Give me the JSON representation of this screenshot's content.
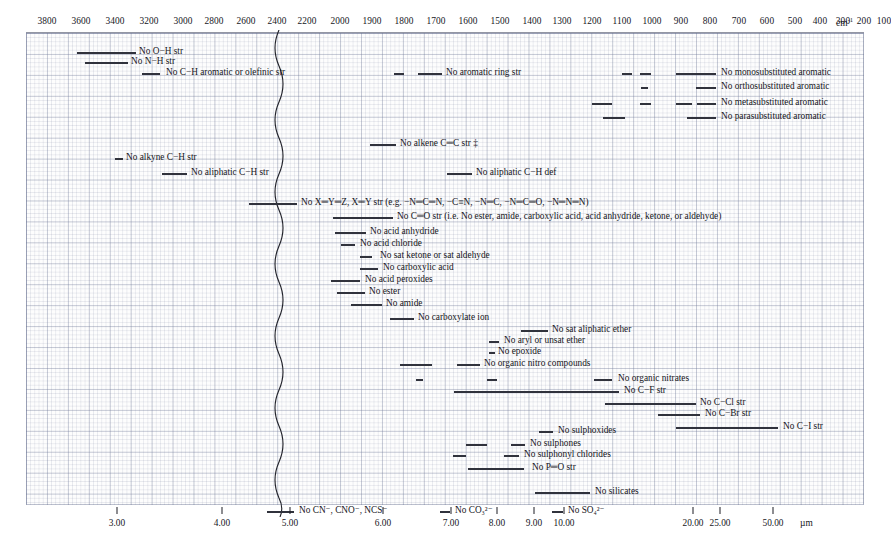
{
  "axes": {
    "top": {
      "unit_label": "cm",
      "unit_sup": "-1",
      "ticks": [
        3800,
        3600,
        3400,
        3200,
        3000,
        2800,
        2600,
        2400,
        2200,
        2000,
        1900,
        1800,
        1700,
        1600,
        1500,
        1400,
        1300,
        1200,
        1100,
        1000,
        900,
        800,
        700,
        600,
        500,
        400,
        300,
        200,
        100
      ]
    },
    "bottom": {
      "unit_label": "µm",
      "ticks": [
        "3.00",
        "4.00",
        "5.00",
        "6.00",
        "7.00",
        "8.00",
        "9.00",
        "10.00",
        "20.00",
        "25.00",
        "50.00"
      ]
    }
  },
  "scale_break": {
    "name": "scale-break-squiggle",
    "wavenumber": 2000
  },
  "chart_data": {
    "type": "bar",
    "xlabel": "cm-1",
    "ylabel": "",
    "orientation": "horizontal-range-bars",
    "xlim_left_segment": [
      4000,
      2000
    ],
    "xlim_right_segment": [
      2000,
      0
    ],
    "grid": true,
    "legend": null,
    "rows": [
      {
        "label": "No O−H str",
        "label_x": 139,
        "segments": [
          [
            77,
            136
          ]
        ]
      },
      {
        "label": "No N−H str",
        "label_x": 131,
        "segments": [
          [
            85,
            128
          ]
        ]
      },
      {
        "label": "No C−H aromatic or olefinic str",
        "label_x": 166,
        "segments": [
          [
            142,
            160
          ]
        ]
      },
      {
        "label": "No aromatic ring str",
        "label_x": 446,
        "segments": [
          [
            394,
            404
          ],
          [
            418,
            442
          ]
        ]
      },
      {
        "label": "No monosubstituted aromatic",
        "label_x": 721,
        "segments": [
          [
            622,
            632
          ],
          [
            640,
            651
          ],
          [
            676,
            716
          ]
        ]
      },
      {
        "label": "No orthosubstituted aromatic",
        "label_x": 721,
        "segments": [
          [
            641,
            648
          ],
          [
            696,
            716
          ]
        ]
      },
      {
        "label": "No metasubstituted aromatic",
        "label_x": 721,
        "segments": [
          [
            592,
            612
          ],
          [
            640,
            651
          ],
          [
            676,
            692
          ],
          [
            697,
            716
          ]
        ]
      },
      {
        "label": "No parasubstituted aromatic",
        "label_x": 721,
        "segments": [
          [
            603,
            625
          ],
          [
            687,
            716
          ]
        ]
      },
      {
        "label": "No alkene C═C str ‡",
        "label_x": 400,
        "segments": [
          [
            370,
            396
          ]
        ]
      },
      {
        "label": "No alkyne C−H str",
        "label_x": 126,
        "segments": [
          [
            115,
            123
          ]
        ]
      },
      {
        "label": "No aliphatic C−H str",
        "label_x": 191,
        "segments": [
          [
            162,
            187
          ]
        ]
      },
      {
        "label": "No aliphatic C−H def",
        "label_x": 476,
        "segments": [
          [
            447,
            472
          ]
        ]
      },
      {
        "label": "No X═Y═Z, X═Y str (e.g. −N═C═N, −C≡N, −N═C, −N═C═O, −N═N═N)",
        "label_x": 301,
        "segments": [
          [
            249,
            297
          ]
        ]
      },
      {
        "label": "No C═O str (i.e. No ester, amide, carboxylic acid, acid anhydride, ketone, or aldehyde)",
        "label_x": 397,
        "segments": [
          [
            333,
            393
          ]
        ]
      },
      {
        "label": "No acid anhydride",
        "label_x": 370,
        "segments": [
          [
            335,
            366
          ]
        ]
      },
      {
        "label": "No acid chloride",
        "label_x": 360,
        "segments": [
          [
            341,
            355
          ]
        ]
      },
      {
        "label": "No sat ketone or sat aldehyde",
        "label_x": 380,
        "segments": [
          [
            360,
            372
          ]
        ]
      },
      {
        "label": "No carboxylic acid",
        "label_x": 383,
        "segments": [
          [
            360,
            378
          ]
        ]
      },
      {
        "label": "No acid peroxides",
        "label_x": 365,
        "segments": [
          [
            331,
            360
          ]
        ]
      },
      {
        "label": "No ester",
        "label_x": 369,
        "segments": [
          [
            337,
            365
          ]
        ]
      },
      {
        "label": "No amide",
        "label_x": 386,
        "segments": [
          [
            351,
            382
          ]
        ]
      },
      {
        "label": "No carboxylate ion",
        "label_x": 418,
        "segments": [
          [
            390,
            414
          ]
        ]
      },
      {
        "label": "No sat aliphatic ether",
        "label_x": 552,
        "segments": [
          [
            521,
            548
          ]
        ]
      },
      {
        "label": "No aryl or unsat ether",
        "label_x": 504,
        "segments": [
          [
            489,
            499
          ]
        ]
      },
      {
        "label": "No epoxide",
        "label_x": 498,
        "segments": [
          [
            489,
            495
          ]
        ]
      },
      {
        "label": "No organic nitro compounds",
        "label_x": 484,
        "segments": [
          [
            400,
            432
          ]
        ],
        "segments_extra": [
          [
            457,
            480
          ]
        ]
      },
      {
        "label": "No organic nitrates",
        "label_x": 618,
        "segments": [
          [
            416,
            423
          ]
        ],
        "segments_extra": [
          [
            487,
            497
          ],
          [
            594,
            612
          ]
        ]
      },
      {
        "label": "No C−F str",
        "label_x": 624,
        "segments": [
          [
            454,
            619
          ]
        ]
      },
      {
        "label": "No C−Cl str",
        "label_x": 700,
        "segments": [
          [
            605,
            696
          ]
        ]
      },
      {
        "label": "No C−Br str",
        "label_x": 705,
        "segments": [
          [
            658,
            700
          ]
        ]
      },
      {
        "label": "No C−I str",
        "label_x": 783,
        "segments": [
          [
            676,
            778
          ]
        ]
      },
      {
        "label": "No sulphoxides",
        "label_x": 558,
        "segments": [
          [
            539,
            553
          ]
        ]
      },
      {
        "label": "No sulphones",
        "label_x": 530,
        "segments": [
          [
            466,
            487
          ],
          [
            511,
            525
          ]
        ]
      },
      {
        "label": "No sulphonyl chlorides",
        "label_x": 524,
        "segments": [
          [
            453,
            466
          ],
          [
            504,
            519
          ]
        ]
      },
      {
        "label": "No P═O str",
        "label_x": 532,
        "segments": [
          [
            468,
            524
          ]
        ]
      },
      {
        "label": "No silicates",
        "label_x": 595,
        "segments": [
          [
            535,
            590
          ]
        ]
      },
      {
        "label": "No CN⁻, CNO⁻, NCS⁻",
        "label_x": 299,
        "segments": [
          [
            267,
            294
          ]
        ]
      },
      {
        "label": "No CO₃²⁻",
        "label_x": 455,
        "segments": [
          [
            440,
            450
          ]
        ]
      },
      {
        "label": "No SO₄²⁻",
        "label_x": 568,
        "segments": [
          [
            552,
            563
          ]
        ]
      }
    ]
  },
  "rows_render": [
    {
      "y": 47,
      "label": "No O−H str",
      "label_x": 139,
      "bars": [
        [
          77,
          136
        ]
      ]
    },
    {
      "y": 57,
      "label": "No N−H str",
      "label_x": 131,
      "bars": [
        [
          85,
          128
        ]
      ]
    },
    {
      "y": 68,
      "label": "No C−H aromatic or olefinic str",
      "label_x": 166,
      "bars": [
        [
          142,
          160
        ]
      ]
    },
    {
      "y": 68,
      "label": "No aromatic ring str",
      "label_x": 446,
      "bars": [
        [
          394,
          404
        ],
        [
          418,
          442
        ]
      ]
    },
    {
      "y": 68,
      "label": "No monosubstituted aromatic",
      "label_x": 721,
      "bars": [
        [
          622,
          632
        ],
        [
          640,
          651
        ],
        [
          676,
          716
        ]
      ]
    },
    {
      "y": 82,
      "label": "No orthosubstituted aromatic",
      "label_x": 721,
      "bars": [
        [
          641,
          648
        ],
        [
          696,
          716
        ]
      ]
    },
    {
      "y": 98,
      "label": "No metasubstituted aromatic",
      "label_x": 721,
      "bars": [
        [
          592,
          612
        ],
        [
          640,
          651
        ],
        [
          676,
          692
        ],
        [
          697,
          716
        ]
      ]
    },
    {
      "y": 112,
      "label": "No parasubstituted aromatic",
      "label_x": 721,
      "bars": [
        [
          603,
          625
        ],
        [
          687,
          716
        ]
      ]
    },
    {
      "y": 139,
      "label": "No alkene C═C str ‡",
      "label_x": 400,
      "bars": [
        [
          370,
          396
        ]
      ]
    },
    {
      "y": 153,
      "label": "No alkyne C−H str",
      "label_x": 126,
      "bars": [
        [
          115,
          123
        ]
      ]
    },
    {
      "y": 168,
      "label": "No aliphatic C−H str",
      "label_x": 191,
      "bars": [
        [
          162,
          187
        ]
      ]
    },
    {
      "y": 168,
      "label": "No aliphatic C−H def",
      "label_x": 476,
      "bars": [
        [
          447,
          472
        ]
      ]
    },
    {
      "y": 198,
      "label": "No X═Y═Z, X═Y str (e.g. −N═C═N, −C≡N, −N═C, −N═C═O, −N═N═N)",
      "label_x": 301,
      "bars": [
        [
          249,
          297
        ]
      ]
    },
    {
      "y": 212,
      "label": "No C═O str (i.e. No ester, amide, carboxylic acid, acid anhydride, ketone, or aldehyde)",
      "label_x": 397,
      "bars": [
        [
          333,
          393
        ]
      ]
    },
    {
      "y": 227,
      "label": "No acid anhydride",
      "label_x": 370,
      "bars": [
        [
          335,
          366
        ]
      ]
    },
    {
      "y": 239,
      "label": "No acid chloride",
      "label_x": 360,
      "bars": [
        [
          341,
          355
        ]
      ]
    },
    {
      "y": 251,
      "label": "No sat ketone or sat aldehyde",
      "label_x": 380,
      "bars": [
        [
          360,
          372
        ]
      ]
    },
    {
      "y": 263,
      "label": "No carboxylic acid",
      "label_x": 383,
      "bars": [
        [
          360,
          378
        ]
      ]
    },
    {
      "y": 275,
      "label": "No acid peroxides",
      "label_x": 365,
      "bars": [
        [
          331,
          360
        ]
      ]
    },
    {
      "y": 287,
      "label": "No ester",
      "label_x": 369,
      "bars": [
        [
          337,
          365
        ]
      ]
    },
    {
      "y": 299,
      "label": "No amide",
      "label_x": 386,
      "bars": [
        [
          351,
          382
        ]
      ]
    },
    {
      "y": 313,
      "label": "No carboxylate ion",
      "label_x": 418,
      "bars": [
        [
          390,
          414
        ]
      ]
    },
    {
      "y": 325,
      "label": "No sat aliphatic ether",
      "label_x": 552,
      "bars": [
        [
          521,
          548
        ]
      ]
    },
    {
      "y": 336,
      "label": "No aryl or unsat ether",
      "label_x": 504,
      "bars": [
        [
          489,
          499
        ]
      ]
    },
    {
      "y": 347,
      "label": "No epoxide",
      "label_x": 498,
      "bars": [
        [
          489,
          495
        ]
      ]
    },
    {
      "y": 359,
      "label": "No organic nitro compounds",
      "label_x": 484,
      "bars": [
        [
          400,
          432
        ],
        [
          457,
          480
        ]
      ]
    },
    {
      "y": 374,
      "label": "No organic nitrates",
      "label_x": 618,
      "bars": [
        [
          416,
          423
        ],
        [
          487,
          497
        ],
        [
          594,
          612
        ]
      ]
    },
    {
      "y": 386,
      "label": "No C−F str",
      "label_x": 624,
      "bars": [
        [
          454,
          619
        ]
      ]
    },
    {
      "y": 398,
      "label": "No C−Cl str",
      "label_x": 700,
      "bars": [
        [
          605,
          696
        ]
      ]
    },
    {
      "y": 409,
      "label": "No C−Br str",
      "label_x": 705,
      "bars": [
        [
          658,
          700
        ]
      ]
    },
    {
      "y": 422,
      "label": "No C−I str",
      "label_x": 783,
      "bars": [
        [
          676,
          778
        ]
      ]
    },
    {
      "y": 426,
      "label": "No sulphoxides",
      "label_x": 558,
      "bars": [
        [
          539,
          553
        ]
      ]
    },
    {
      "y": 439,
      "label": "No sulphones",
      "label_x": 530,
      "bars": [
        [
          466,
          487
        ],
        [
          511,
          525
        ]
      ]
    },
    {
      "y": 450,
      "label": "No sulphonyl chlorides",
      "label_x": 524,
      "bars": [
        [
          453,
          466
        ],
        [
          504,
          519
        ]
      ]
    },
    {
      "y": 463,
      "label": "No P═O str",
      "label_x": 532,
      "bars": [
        [
          468,
          524
        ]
      ]
    },
    {
      "y": 487,
      "label": "No silicates",
      "label_x": 595,
      "bars": [
        [
          535,
          590
        ]
      ]
    },
    {
      "y": 506,
      "label": "No CN⁻, CNO⁻, NCS⁻",
      "label_x": 299,
      "bars": [
        [
          267,
          294
        ]
      ]
    },
    {
      "y": 506,
      "label": "No CO₃²⁻",
      "label_x": 455,
      "bars": [
        [
          440,
          450
        ]
      ]
    },
    {
      "y": 506,
      "label": "No SO₄²⁻",
      "label_x": 568,
      "bars": [
        [
          552,
          563
        ]
      ]
    }
  ],
  "top_tick_positions": [
    {
      "v": 3800,
      "x": 47
    },
    {
      "v": 3600,
      "x": 81
    },
    {
      "v": 3400,
      "x": 115
    },
    {
      "v": 3200,
      "x": 149
    },
    {
      "v": 3000,
      "x": 183
    },
    {
      "v": 2800,
      "x": 214
    },
    {
      "v": 2600,
      "x": 246
    },
    {
      "v": 2400,
      "x": 277
    },
    {
      "v": 2200,
      "x": 307
    },
    {
      "v": 2000,
      "x": 340
    },
    {
      "v": 1900,
      "x": 372
    },
    {
      "v": 1800,
      "x": 404
    },
    {
      "v": 1700,
      "x": 436
    },
    {
      "v": 1600,
      "x": 468
    },
    {
      "v": 1500,
      "x": 500
    },
    {
      "v": 1400,
      "x": 532
    },
    {
      "v": 1300,
      "x": 562
    },
    {
      "v": 1200,
      "x": 592
    },
    {
      "v": 1100,
      "x": 622
    },
    {
      "v": 1000,
      "x": 652
    },
    {
      "v": 900,
      "x": 681
    },
    {
      "v": 800,
      "x": 710
    },
    {
      "v": 700,
      "x": 739
    },
    {
      "v": 600,
      "x": 767
    },
    {
      "v": 500,
      "x": 795
    },
    {
      "v": 400,
      "x": 820
    },
    {
      "v": 300,
      "x": 843
    },
    {
      "v": 200,
      "x": 864
    },
    {
      "v": 100,
      "x": 884
    }
  ],
  "bottom_tick_positions": [
    {
      "v": "3.00",
      "x": 117
    },
    {
      "v": "4.00",
      "x": 222
    },
    {
      "v": "5.00",
      "x": 290
    },
    {
      "v": "6.00",
      "x": 383
    },
    {
      "v": "7.00",
      "x": 451
    },
    {
      "v": "8.00",
      "x": 497
    },
    {
      "v": "9.00",
      "x": 534
    },
    {
      "v": "10.00",
      "x": 564
    },
    {
      "v": "20.00",
      "x": 693
    },
    {
      "v": "25.00",
      "x": 720
    },
    {
      "v": "50.00",
      "x": 773
    }
  ]
}
